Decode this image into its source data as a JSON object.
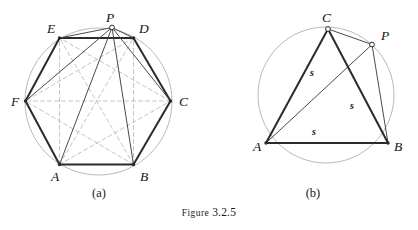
{
  "figure": {
    "caption_prefix": "Figure",
    "caption_number": "3.2.5",
    "background_color": "#ffffff",
    "stroke_dark": "#2b2b2b",
    "stroke_thin": "#4a4a4a",
    "stroke_circle": "#b0b0b0",
    "stroke_dashed": "#bdbdbd"
  },
  "panel_a": {
    "sublabel": "(a)",
    "circle": {
      "cx": 98.5,
      "cy": 101.5,
      "r": 73.5
    },
    "vertices": [
      {
        "name": "A",
        "x": 59.5,
        "y": 164.5,
        "label_x": 51,
        "label_y": 181,
        "marker": "dot"
      },
      {
        "name": "B",
        "x": 133.5,
        "y": 164.5,
        "label_x": 140,
        "label_y": 181,
        "marker": "dot"
      },
      {
        "name": "C",
        "x": 170.5,
        "y": 101.0,
        "label_x": 179,
        "label_y": 106,
        "marker": "dot"
      },
      {
        "name": "D",
        "x": 133.5,
        "y": 38.0,
        "label_x": 139,
        "label_y": 33,
        "marker": "dot"
      },
      {
        "name": "E",
        "x": 59.5,
        "y": 38.0,
        "label_x": 47,
        "label_y": 33,
        "marker": "dot"
      },
      {
        "name": "F",
        "x": 25.5,
        "y": 101.0,
        "label_x": 11,
        "label_y": 106,
        "marker": "dot"
      },
      {
        "name": "P",
        "x": 112.0,
        "y": 27.5,
        "label_x": 106,
        "label_y": 22,
        "marker": "circle"
      }
    ],
    "hexagon_sides": [
      {
        "from": "A",
        "to": "B"
      },
      {
        "from": "B",
        "to": "C"
      },
      {
        "from": "C",
        "to": "D"
      },
      {
        "from": "D",
        "to": "E"
      },
      {
        "from": "E",
        "to": "F"
      },
      {
        "from": "F",
        "to": "A"
      }
    ],
    "rays_from_p": [
      {
        "from": "P",
        "to": "A"
      },
      {
        "from": "P",
        "to": "B"
      },
      {
        "from": "P",
        "to": "C"
      },
      {
        "from": "P",
        "to": "D"
      },
      {
        "from": "P",
        "to": "E"
      },
      {
        "from": "P",
        "to": "F"
      }
    ],
    "dashed_diagonals": [
      {
        "from": "A",
        "to": "C"
      },
      {
        "from": "A",
        "to": "D"
      },
      {
        "from": "A",
        "to": "E"
      },
      {
        "from": "B",
        "to": "D"
      },
      {
        "from": "B",
        "to": "E"
      },
      {
        "from": "B",
        "to": "F"
      },
      {
        "from": "C",
        "to": "E"
      },
      {
        "from": "C",
        "to": "F"
      },
      {
        "from": "D",
        "to": "F"
      }
    ]
  },
  "panel_b": {
    "sublabel": "(b)",
    "circle": {
      "cx": 326.0,
      "cy": 95.0,
      "r": 68.0
    },
    "vertices": [
      {
        "name": "A",
        "x": 266.0,
        "y": 143.0,
        "label_x": 253,
        "label_y": 151,
        "marker": "dot"
      },
      {
        "name": "B",
        "x": 388.0,
        "y": 143.0,
        "label_x": 394,
        "label_y": 151,
        "marker": "dot"
      },
      {
        "name": "C",
        "x": 328.0,
        "y": 29.0,
        "label_x": 322,
        "label_y": 22,
        "marker": "circle"
      },
      {
        "name": "P",
        "x": 372.0,
        "y": 44.5,
        "label_x": 381,
        "label_y": 40,
        "marker": "circle"
      }
    ],
    "triangle_sides": [
      {
        "from": "A",
        "to": "B"
      },
      {
        "from": "A",
        "to": "C"
      },
      {
        "from": "C",
        "to": "B"
      }
    ],
    "chords": [
      {
        "from": "C",
        "to": "P"
      },
      {
        "from": "P",
        "to": "B"
      },
      {
        "from": "A",
        "to": "P"
      }
    ],
    "segment_labels": [
      {
        "text": "s",
        "x": 310,
        "y": 76
      },
      {
        "text": "s",
        "x": 350,
        "y": 109
      },
      {
        "text": "s",
        "x": 312,
        "y": 135
      }
    ]
  }
}
